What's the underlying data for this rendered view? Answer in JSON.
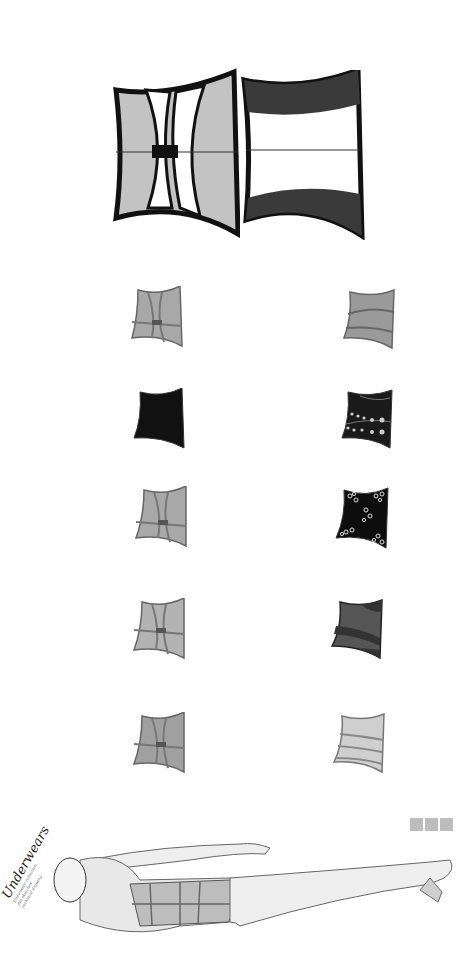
{
  "title": "Underwears",
  "subtitle_lines": [
    "Underwear collection",
    "flat sketches",
    "technical drawing"
  ],
  "colors": {
    "light_gray": "#c3c3c3",
    "mid_gray": "#9a9a9a",
    "dark_gray": "#4a4a4a",
    "black": "#111111",
    "outline": "#333333",
    "swatch": "#bdbdbd"
  },
  "hero": {
    "front_label": "front view",
    "back_label": "back view"
  },
  "variants": [
    {
      "id": "v1",
      "side": "left",
      "style": "light-gray-straps"
    },
    {
      "id": "v2",
      "side": "right",
      "style": "gray-bands"
    },
    {
      "id": "v3",
      "side": "left",
      "style": "black-solid"
    },
    {
      "id": "v4",
      "side": "right",
      "style": "black-star-print"
    },
    {
      "id": "v5",
      "side": "left",
      "style": "light-gray-straps"
    },
    {
      "id": "v6",
      "side": "right",
      "style": "black-floral-print"
    },
    {
      "id": "v7",
      "side": "left",
      "style": "light-gray-straps"
    },
    {
      "id": "v8",
      "side": "right",
      "style": "dark-gray-bands"
    },
    {
      "id": "v9",
      "side": "left",
      "style": "light-gray-straps"
    },
    {
      "id": "v10",
      "side": "right",
      "style": "light-gray-bands"
    }
  ],
  "swatches": [
    "#bdbdbd",
    "#bdbdbd",
    "#bdbdbd"
  ]
}
